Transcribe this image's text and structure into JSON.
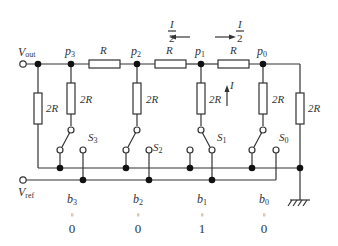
{
  "labels": {
    "vout": "V",
    "vout_sub": "out",
    "vref": "V",
    "vref_sub": "ref",
    "nodes": [
      "p3",
      "p2",
      "p1",
      "p0"
    ],
    "node_letter": "p",
    "node_subs": [
      "3",
      "2",
      "1",
      "0"
    ],
    "series_resistor": "R",
    "shunt_resistor": "2R",
    "current": "I",
    "half_current_num": "I",
    "half_current_den": "2",
    "switch_letter": "S",
    "switch_subs": [
      "3",
      "2",
      "1",
      "0"
    ],
    "bit_letter": "b",
    "bit_subs": [
      "3",
      "2",
      "1",
      "0"
    ],
    "equals": "=",
    "bit_values": [
      "0",
      "0",
      "1",
      "0"
    ]
  }
}
